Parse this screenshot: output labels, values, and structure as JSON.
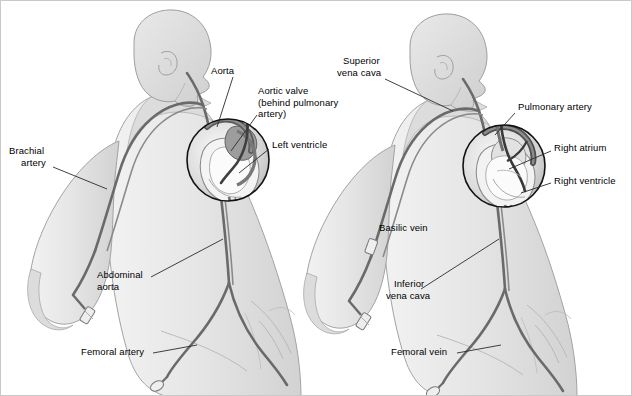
{
  "figure": {
    "background_color": "#ffffff",
    "border_color": "#c9c9c9",
    "text_color": "#000000",
    "body_fill": "#e4e4e4",
    "body_fill_dark": "#d2d2d2",
    "body_outline": "#9a9a9a",
    "vessel_color": "#6a6a6a",
    "vessel_dark": "#4a4a4a",
    "inset_circle_color": "#111111",
    "leader_color": "#2b2b2b"
  },
  "panels": [
    {
      "id": "left-panel",
      "name": "arterial-access-figure",
      "description": "Left-side figure showing arterial catheter route",
      "labels": [
        {
          "id": "aorta",
          "text": "Aorta",
          "lines": [
            "Aorta"
          ],
          "x": 210,
          "y": 68,
          "align": "left"
        },
        {
          "id": "aortic-valve",
          "text": "Aortic valve (behind pulmonary artery)",
          "lines": [
            "Aortic valve",
            "(behind pulmonary",
            "artery)"
          ],
          "x": 257,
          "y": 88,
          "align": "left"
        },
        {
          "id": "left-ventricle",
          "text": "Left ventricle",
          "lines": [
            "Left ventricle"
          ],
          "x": 271,
          "y": 142,
          "align": "left"
        },
        {
          "id": "brachial-artery",
          "text": "Brachial artery",
          "lines": [
            "Brachial",
            "artery"
          ],
          "x": 8,
          "y": 148,
          "align": "left"
        },
        {
          "id": "abdominal-aorta",
          "text": "Abdominal aorta",
          "lines": [
            "Abdominal",
            "aorta"
          ],
          "x": 96,
          "y": 272,
          "align": "left"
        },
        {
          "id": "femoral-artery",
          "text": "Femoral artery",
          "lines": [
            "Femoral artery"
          ],
          "x": 80,
          "y": 349,
          "align": "left"
        }
      ]
    },
    {
      "id": "right-panel",
      "name": "venous-access-figure",
      "description": "Right-side figure showing venous catheter route",
      "labels": [
        {
          "id": "superior-vena-cava",
          "text": "Superior vena cava",
          "lines": [
            "Superior",
            "vena cava"
          ],
          "x": 336,
          "y": 58,
          "align": "left"
        },
        {
          "id": "pulmonary-artery",
          "text": "Pulmonary artery",
          "lines": [
            "Pulmonary artery"
          ],
          "x": 517,
          "y": 104,
          "align": "left"
        },
        {
          "id": "right-atrium",
          "text": "Right atrium",
          "lines": [
            "Right atrium"
          ],
          "x": 553,
          "y": 145,
          "align": "left"
        },
        {
          "id": "right-ventricle",
          "text": "Right ventricle",
          "lines": [
            "Right ventricle"
          ],
          "x": 553,
          "y": 178,
          "align": "left"
        },
        {
          "id": "basilic-vein",
          "text": "Basilic vein",
          "lines": [
            "Basilic vein"
          ],
          "x": 378,
          "y": 225,
          "align": "left"
        },
        {
          "id": "inferior-vena-cava",
          "text": "Inferior vena cava",
          "lines": [
            "Inferior",
            "vena cava"
          ],
          "x": 385,
          "y": 281,
          "align": "left"
        },
        {
          "id": "femoral-vein",
          "text": "Femoral vein",
          "lines": [
            "Femoral vein"
          ],
          "x": 390,
          "y": 349,
          "align": "left"
        }
      ]
    }
  ],
  "insets": [
    {
      "id": "left-heart-inset",
      "name": "heart-detail-circle-left",
      "cx": 227,
      "cy": 159,
      "r": 41
    },
    {
      "id": "right-heart-inset",
      "name": "heart-detail-circle-right",
      "cx": 503,
      "cy": 165,
      "r": 41
    }
  ]
}
